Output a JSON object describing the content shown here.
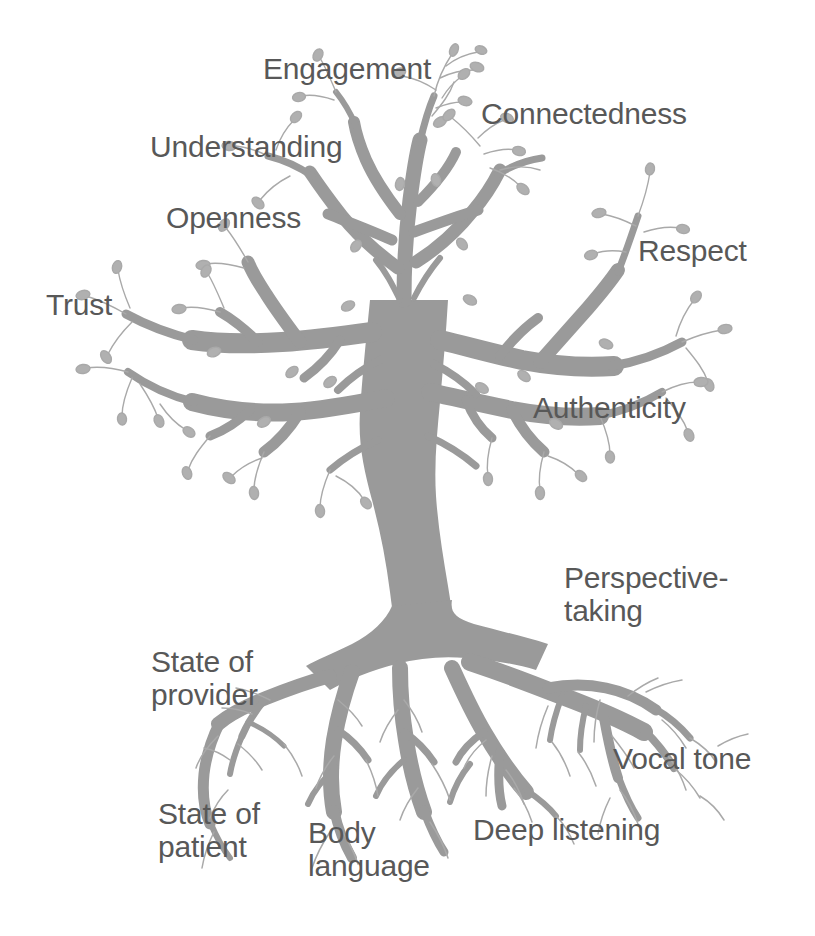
{
  "figure": {
    "kind": "concept-tree-diagram",
    "background_color": "#ffffff",
    "tree_color": "#9a9a9a",
    "twig_color": "#a9a9a9",
    "text_color": "#585858"
  },
  "canopy": {
    "group_label": "Branches and leaves (outcomes)",
    "labels": [
      {
        "id": "engagement",
        "text": "Engagement"
      },
      {
        "id": "connectedness",
        "text": "Connectedness"
      },
      {
        "id": "understanding",
        "text": "Understanding"
      },
      {
        "id": "openness",
        "text": "Openness"
      },
      {
        "id": "trust",
        "text": "Trust"
      },
      {
        "id": "respect",
        "text": "Respect"
      },
      {
        "id": "authenticity",
        "text": "Authenticity"
      }
    ]
  },
  "roots": {
    "group_label": "Roots (foundations)",
    "labels": [
      {
        "id": "perspective-taking",
        "text": "Perspective-\ntaking"
      },
      {
        "id": "state-of-provider",
        "text": "State of\nprovider"
      },
      {
        "id": "vocal-tone",
        "text": "Vocal tone"
      },
      {
        "id": "state-of-patient",
        "text": "State of\npatient"
      },
      {
        "id": "body-language",
        "text": "Body\nlanguage"
      },
      {
        "id": "deep-listening",
        "text": "Deep listening"
      }
    ]
  }
}
